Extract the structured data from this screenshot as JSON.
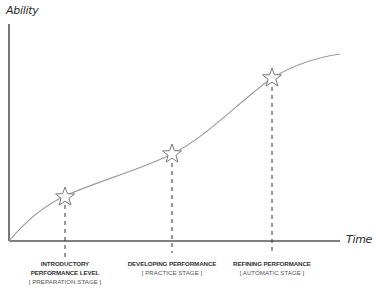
{
  "diagram": {
    "y_axis_label": "Ability",
    "x_axis_label": "Time",
    "colors": {
      "axis": "#555555",
      "curve": "#9a9a9a",
      "star_stroke": "#7a7a7a",
      "dashed": "#333333",
      "text": "#333333"
    },
    "milestones": [
      {
        "title_line1": "INTRODUCTORY",
        "title_line2": "PERFORMANCE LEVEL",
        "stage": "[ PREPARATION STAGE ]",
        "icon": "star-icon"
      },
      {
        "title_line1": "DEVELOPING PERFORMANCE",
        "title_line2": "",
        "stage": "[ PRACTICE STAGE ]",
        "icon": "star-icon"
      },
      {
        "title_line1": "REFINING PERFORMANCE",
        "title_line2": "",
        "stage": "[ AUTOMATIC STAGE ]",
        "icon": "star-icon"
      }
    ]
  }
}
